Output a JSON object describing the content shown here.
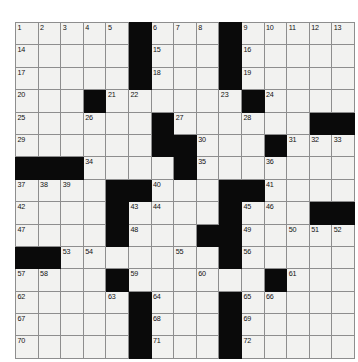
{
  "puzzle": {
    "title": "Crossword Puzzle Grid",
    "rows": 15,
    "columns": 15,
    "colors": {
      "cell_fill": "#f2f2f0",
      "block_fill": "#0a0a0a",
      "grid_line": "#8e8e8e",
      "number_text": "#111111",
      "page_background": "#ffffff"
    },
    "clue_number_count": 72,
    "first_clue_number": 1,
    "last_clue_number": 72,
    "grid": [
      [
        {
          "block": false,
          "num": "1"
        },
        {
          "block": false,
          "num": "2"
        },
        {
          "block": false,
          "num": "3"
        },
        {
          "block": false,
          "num": "4"
        },
        {
          "block": false,
          "num": "5"
        },
        {
          "block": true,
          "num": ""
        },
        {
          "block": false,
          "num": "6"
        },
        {
          "block": false,
          "num": "7"
        },
        {
          "block": false,
          "num": "8"
        },
        {
          "block": true,
          "num": ""
        },
        {
          "block": false,
          "num": "9"
        },
        {
          "block": false,
          "num": "10"
        },
        {
          "block": false,
          "num": "11"
        },
        {
          "block": false,
          "num": "12"
        },
        {
          "block": false,
          "num": "13"
        }
      ],
      [
        {
          "block": false,
          "num": "14"
        },
        {
          "block": false,
          "num": ""
        },
        {
          "block": false,
          "num": ""
        },
        {
          "block": false,
          "num": ""
        },
        {
          "block": false,
          "num": ""
        },
        {
          "block": true,
          "num": ""
        },
        {
          "block": false,
          "num": "15"
        },
        {
          "block": false,
          "num": ""
        },
        {
          "block": false,
          "num": ""
        },
        {
          "block": true,
          "num": ""
        },
        {
          "block": false,
          "num": "16"
        },
        {
          "block": false,
          "num": ""
        },
        {
          "block": false,
          "num": ""
        },
        {
          "block": false,
          "num": ""
        },
        {
          "block": false,
          "num": ""
        }
      ],
      [
        {
          "block": false,
          "num": "17"
        },
        {
          "block": false,
          "num": ""
        },
        {
          "block": false,
          "num": ""
        },
        {
          "block": false,
          "num": ""
        },
        {
          "block": false,
          "num": ""
        },
        {
          "block": true,
          "num": ""
        },
        {
          "block": false,
          "num": "18"
        },
        {
          "block": false,
          "num": ""
        },
        {
          "block": false,
          "num": ""
        },
        {
          "block": true,
          "num": ""
        },
        {
          "block": false,
          "num": "19"
        },
        {
          "block": false,
          "num": ""
        },
        {
          "block": false,
          "num": ""
        },
        {
          "block": false,
          "num": ""
        },
        {
          "block": false,
          "num": ""
        }
      ],
      [
        {
          "block": false,
          "num": "20"
        },
        {
          "block": false,
          "num": ""
        },
        {
          "block": false,
          "num": ""
        },
        {
          "block": true,
          "num": ""
        },
        {
          "block": false,
          "num": "21"
        },
        {
          "block": false,
          "num": "22"
        },
        {
          "block": false,
          "num": ""
        },
        {
          "block": false,
          "num": ""
        },
        {
          "block": false,
          "num": ""
        },
        {
          "block": false,
          "num": "23"
        },
        {
          "block": true,
          "num": ""
        },
        {
          "block": false,
          "num": "24"
        },
        {
          "block": false,
          "num": ""
        },
        {
          "block": false,
          "num": ""
        },
        {
          "block": false,
          "num": ""
        }
      ],
      [
        {
          "block": false,
          "num": "25"
        },
        {
          "block": false,
          "num": ""
        },
        {
          "block": false,
          "num": ""
        },
        {
          "block": false,
          "num": "26"
        },
        {
          "block": false,
          "num": ""
        },
        {
          "block": false,
          "num": ""
        },
        {
          "block": true,
          "num": ""
        },
        {
          "block": false,
          "num": "27"
        },
        {
          "block": false,
          "num": ""
        },
        {
          "block": false,
          "num": ""
        },
        {
          "block": false,
          "num": "28"
        },
        {
          "block": false,
          "num": ""
        },
        {
          "block": false,
          "num": ""
        },
        {
          "block": true,
          "num": ""
        },
        {
          "block": true,
          "num": ""
        }
      ],
      [
        {
          "block": false,
          "num": "29"
        },
        {
          "block": false,
          "num": ""
        },
        {
          "block": false,
          "num": ""
        },
        {
          "block": false,
          "num": ""
        },
        {
          "block": false,
          "num": ""
        },
        {
          "block": false,
          "num": ""
        },
        {
          "block": true,
          "num": ""
        },
        {
          "block": true,
          "num": ""
        },
        {
          "block": false,
          "num": "30"
        },
        {
          "block": false,
          "num": ""
        },
        {
          "block": false,
          "num": ""
        },
        {
          "block": true,
          "num": ""
        },
        {
          "block": false,
          "num": "31"
        },
        {
          "block": false,
          "num": "32"
        },
        {
          "block": false,
          "num": "33"
        }
      ],
      [
        {
          "block": true,
          "num": ""
        },
        {
          "block": true,
          "num": ""
        },
        {
          "block": true,
          "num": ""
        },
        {
          "block": false,
          "num": "34"
        },
        {
          "block": false,
          "num": ""
        },
        {
          "block": false,
          "num": ""
        },
        {
          "block": false,
          "num": ""
        },
        {
          "block": true,
          "num": ""
        },
        {
          "block": false,
          "num": "35"
        },
        {
          "block": false,
          "num": ""
        },
        {
          "block": false,
          "num": ""
        },
        {
          "block": false,
          "num": "36"
        },
        {
          "block": false,
          "num": ""
        },
        {
          "block": false,
          "num": ""
        },
        {
          "block": false,
          "num": ""
        }
      ],
      [
        {
          "block": false,
          "num": "37"
        },
        {
          "block": false,
          "num": "38"
        },
        {
          "block": false,
          "num": "39"
        },
        {
          "block": false,
          "num": ""
        },
        {
          "block": true,
          "num": ""
        },
        {
          "block": true,
          "num": ""
        },
        {
          "block": false,
          "num": "40"
        },
        {
          "block": false,
          "num": ""
        },
        {
          "block": false,
          "num": ""
        },
        {
          "block": true,
          "num": ""
        },
        {
          "block": true,
          "num": ""
        },
        {
          "block": false,
          "num": "41"
        },
        {
          "block": false,
          "num": ""
        },
        {
          "block": false,
          "num": ""
        },
        {
          "block": false,
          "num": ""
        }
      ],
      [
        {
          "block": false,
          "num": "42"
        },
        {
          "block": false,
          "num": ""
        },
        {
          "block": false,
          "num": ""
        },
        {
          "block": false,
          "num": ""
        },
        {
          "block": true,
          "num": ""
        },
        {
          "block": false,
          "num": "43"
        },
        {
          "block": false,
          "num": "44"
        },
        {
          "block": false,
          "num": ""
        },
        {
          "block": false,
          "num": ""
        },
        {
          "block": true,
          "num": ""
        },
        {
          "block": false,
          "num": "45"
        },
        {
          "block": false,
          "num": "46"
        },
        {
          "block": false,
          "num": ""
        },
        {
          "block": true,
          "num": ""
        },
        {
          "block": true,
          "num": ""
        }
      ],
      [
        {
          "block": false,
          "num": "47"
        },
        {
          "block": false,
          "num": ""
        },
        {
          "block": false,
          "num": ""
        },
        {
          "block": false,
          "num": ""
        },
        {
          "block": true,
          "num": ""
        },
        {
          "block": false,
          "num": "48"
        },
        {
          "block": false,
          "num": ""
        },
        {
          "block": false,
          "num": ""
        },
        {
          "block": true,
          "num": ""
        },
        {
          "block": true,
          "num": ""
        },
        {
          "block": false,
          "num": "49"
        },
        {
          "block": false,
          "num": ""
        },
        {
          "block": false,
          "num": "50"
        },
        {
          "block": false,
          "num": "51"
        },
        {
          "block": false,
          "num": "52"
        }
      ],
      [
        {
          "block": true,
          "num": ""
        },
        {
          "block": true,
          "num": ""
        },
        {
          "block": false,
          "num": "53"
        },
        {
          "block": false,
          "num": "54"
        },
        {
          "block": false,
          "num": ""
        },
        {
          "block": false,
          "num": ""
        },
        {
          "block": false,
          "num": ""
        },
        {
          "block": false,
          "num": "55"
        },
        {
          "block": false,
          "num": ""
        },
        {
          "block": true,
          "num": ""
        },
        {
          "block": false,
          "num": "56"
        },
        {
          "block": false,
          "num": ""
        },
        {
          "block": false,
          "num": ""
        },
        {
          "block": false,
          "num": ""
        },
        {
          "block": false,
          "num": ""
        }
      ],
      [
        {
          "block": false,
          "num": "57"
        },
        {
          "block": false,
          "num": "58"
        },
        {
          "block": false,
          "num": ""
        },
        {
          "block": false,
          "num": ""
        },
        {
          "block": true,
          "num": ""
        },
        {
          "block": false,
          "num": "59"
        },
        {
          "block": false,
          "num": ""
        },
        {
          "block": false,
          "num": ""
        },
        {
          "block": false,
          "num": "60"
        },
        {
          "block": false,
          "num": ""
        },
        {
          "block": false,
          "num": ""
        },
        {
          "block": true,
          "num": ""
        },
        {
          "block": false,
          "num": "61"
        },
        {
          "block": false,
          "num": ""
        },
        {
          "block": false,
          "num": ""
        }
      ],
      [
        {
          "block": false,
          "num": "62"
        },
        {
          "block": false,
          "num": ""
        },
        {
          "block": false,
          "num": ""
        },
        {
          "block": false,
          "num": ""
        },
        {
          "block": false,
          "num": "63"
        },
        {
          "block": true,
          "num": ""
        },
        {
          "block": false,
          "num": "64"
        },
        {
          "block": false,
          "num": ""
        },
        {
          "block": false,
          "num": ""
        },
        {
          "block": true,
          "num": ""
        },
        {
          "block": false,
          "num": "65"
        },
        {
          "block": false,
          "num": "66"
        },
        {
          "block": false,
          "num": ""
        },
        {
          "block": false,
          "num": ""
        },
        {
          "block": false,
          "num": ""
        }
      ],
      [
        {
          "block": false,
          "num": "67"
        },
        {
          "block": false,
          "num": ""
        },
        {
          "block": false,
          "num": ""
        },
        {
          "block": false,
          "num": ""
        },
        {
          "block": false,
          "num": ""
        },
        {
          "block": true,
          "num": ""
        },
        {
          "block": false,
          "num": "68"
        },
        {
          "block": false,
          "num": ""
        },
        {
          "block": false,
          "num": ""
        },
        {
          "block": true,
          "num": ""
        },
        {
          "block": false,
          "num": "69"
        },
        {
          "block": false,
          "num": ""
        },
        {
          "block": false,
          "num": ""
        },
        {
          "block": false,
          "num": ""
        },
        {
          "block": false,
          "num": ""
        }
      ],
      [
        {
          "block": false,
          "num": "70"
        },
        {
          "block": false,
          "num": ""
        },
        {
          "block": false,
          "num": ""
        },
        {
          "block": false,
          "num": ""
        },
        {
          "block": false,
          "num": ""
        },
        {
          "block": true,
          "num": ""
        },
        {
          "block": false,
          "num": "71"
        },
        {
          "block": false,
          "num": ""
        },
        {
          "block": false,
          "num": ""
        },
        {
          "block": true,
          "num": ""
        },
        {
          "block": false,
          "num": "72"
        },
        {
          "block": false,
          "num": ""
        },
        {
          "block": false,
          "num": ""
        },
        {
          "block": false,
          "num": ""
        },
        {
          "block": false,
          "num": ""
        }
      ]
    ]
  }
}
